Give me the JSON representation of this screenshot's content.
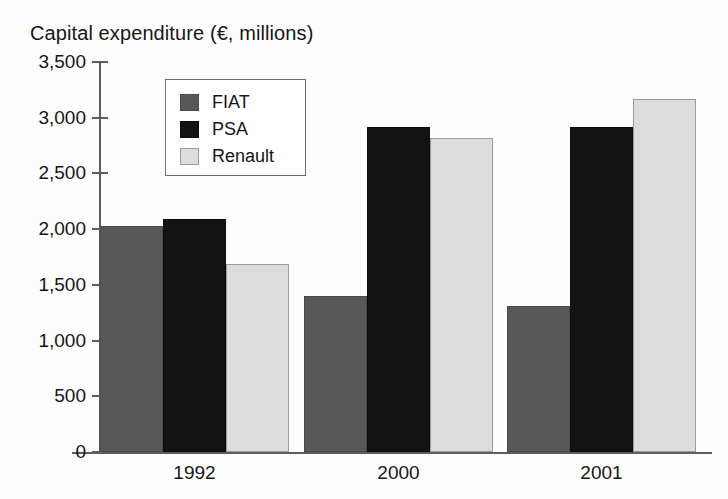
{
  "chart_data": {
    "type": "bar",
    "title": "Capital expenditure (€, millions)",
    "xlabel": "",
    "ylabel": "",
    "categories": [
      "1992",
      "2000",
      "2001"
    ],
    "series": [
      {
        "name": "FIAT",
        "color": "#585858",
        "values": [
          2030,
          1400,
          1310
        ]
      },
      {
        "name": "PSA",
        "color": "#131313",
        "values": [
          2090,
          2920,
          2920
        ]
      },
      {
        "name": "Renault",
        "color": "#dcdcdc",
        "values": [
          1690,
          2820,
          3170
        ]
      }
    ],
    "ylim": [
      0,
      3500
    ],
    "ytick_values": [
      0,
      500,
      1000,
      1500,
      2000,
      2500,
      3000,
      3500
    ],
    "ytick_labels": [
      "0",
      "500",
      "1,000",
      "1,500",
      "2,000",
      "2,500",
      "3,000",
      "3,500"
    ],
    "grid": false,
    "legend_position": "upper-left-inside",
    "legend_entries": [
      "FIAT",
      "PSA",
      "Renault"
    ]
  }
}
